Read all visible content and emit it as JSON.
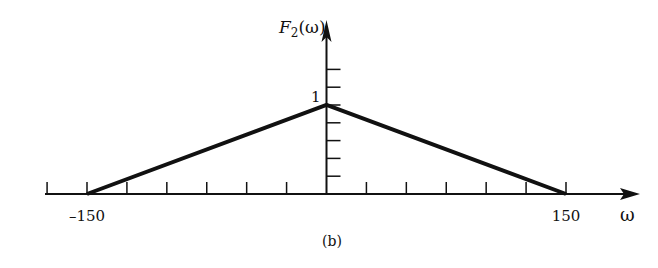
{
  "chart_data": {
    "type": "line",
    "title": "",
    "caption": "(b)",
    "xlabel": "ω",
    "ylabel": "F2(ω)",
    "ylabel_main": "F",
    "ylabel_sub": "2",
    "ylabel_arg": "(ω)",
    "x": [
      -150,
      0,
      150
    ],
    "series": [
      {
        "name": "F2(ω)",
        "values": [
          0,
          1,
          0
        ]
      }
    ],
    "x_tick_labels": [
      {
        "value": -150,
        "label": "–150"
      },
      {
        "value": 150,
        "label": "150"
      }
    ],
    "y_tick_labels": [
      {
        "value": 1,
        "label": "1"
      }
    ],
    "x_tick_step": 25,
    "x_ticks": [
      -175,
      -150,
      -125,
      -100,
      -75,
      -50,
      -25,
      0,
      25,
      50,
      75,
      100,
      125,
      150
    ],
    "y_tick_step": 0.2,
    "y_ticks": [
      0.2,
      0.4,
      0.6,
      0.8,
      1.0,
      1.2,
      1.4
    ],
    "xlim": [
      -175,
      190
    ],
    "ylim": [
      0,
      1.65
    ],
    "grid": false,
    "legend": "none",
    "line_color": "#111111"
  }
}
